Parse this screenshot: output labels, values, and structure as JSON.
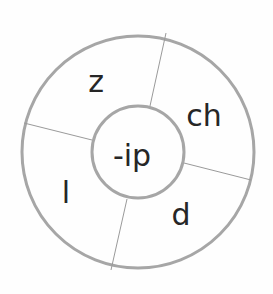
{
  "diagram": {
    "type": "word-wheel",
    "center_label": "-ip",
    "segments": [
      {
        "label": "z",
        "position": "top-left"
      },
      {
        "label": "ch",
        "position": "top-right"
      },
      {
        "label": "d",
        "position": "bottom-right"
      },
      {
        "label": "l",
        "position": "bottom-left"
      }
    ],
    "colors": {
      "ring_stroke": "#a6a6a6",
      "divider_stroke": "#9a9a9a",
      "text": "#262626",
      "background": "#fefefe"
    }
  }
}
